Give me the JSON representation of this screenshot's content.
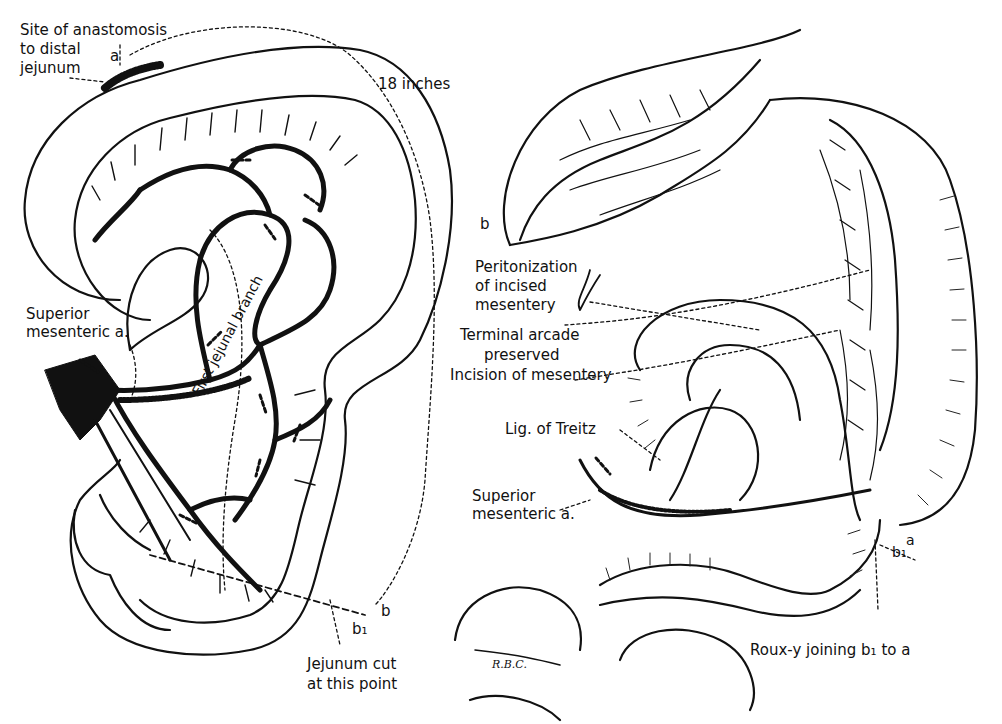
{
  "figure": {
    "panels": [
      {
        "id": "left",
        "labels": {
          "site_line1": "Site of anastomosis",
          "site_line2": "to distal",
          "site_line3": "jejunum",
          "point_a": "a",
          "length": "18 inches",
          "sma_line1": "Superior",
          "sma_line2": "mesenteric a.",
          "first_jejunal_branch": "First jejunal branch",
          "point_b": "b",
          "point_b1": "b₁",
          "cut_line1": "Jejunum cut",
          "cut_line2": "at this point"
        }
      },
      {
        "id": "right",
        "labels": {
          "point_b": "b",
          "perit_line1": "Peritonization",
          "perit_line2": "of incised",
          "perit_line3": "mesentery",
          "treitz": "Lig. of Treitz",
          "sma_line1": "Superior",
          "sma_line2": "mesenteric a.",
          "point_b1": "b₁",
          "point_a": "a",
          "rouxy": "Roux-y joining b₁ to a",
          "signature": "R.B.C."
        }
      }
    ],
    "shared_labels": {
      "terminal_line1": "Terminal arcade",
      "terminal_line2": "preserved",
      "incision": "Incision of mesentery"
    },
    "colors": {
      "ink": "#111111",
      "paper": "#ffffff"
    }
  }
}
